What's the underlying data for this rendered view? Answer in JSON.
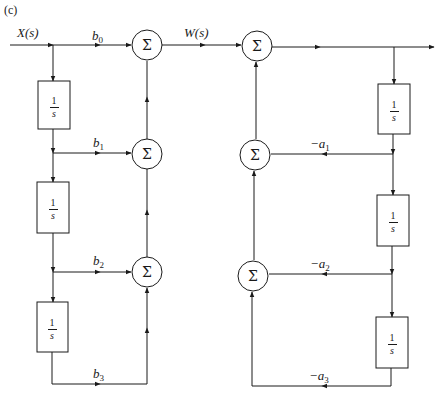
{
  "panel_label": "(c)",
  "signals": {
    "input": "X(s)",
    "intermediate": "W(s)"
  },
  "summer_symbol": "Σ",
  "integrator": {
    "numerator": "1",
    "denominator": "s"
  },
  "gains": {
    "b0": {
      "base": "b",
      "sub": "0"
    },
    "b1": {
      "base": "b",
      "sub": "1"
    },
    "b2": {
      "base": "b",
      "sub": "2"
    },
    "b3": {
      "base": "b",
      "sub": "3"
    },
    "a1": {
      "base": "−a",
      "sub": "1"
    },
    "a2": {
      "base": "−a",
      "sub": "2"
    },
    "a3": {
      "base": "−a",
      "sub": "3"
    }
  },
  "colors": {
    "line": "#1a1a1a",
    "background": "#ffffff"
  }
}
